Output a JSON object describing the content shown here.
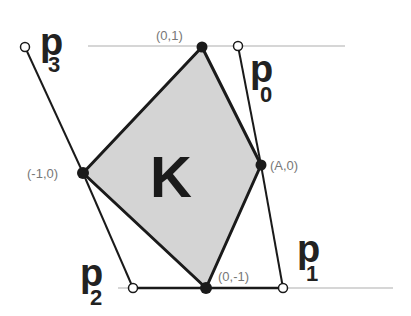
{
  "diagram": {
    "shape_label": "K",
    "vertices": [
      {
        "id": "top",
        "label": "(0,1)",
        "x": 202,
        "y": 47
      },
      {
        "id": "left",
        "label": "(-1,0)",
        "x": 83,
        "y": 173
      },
      {
        "id": "bottom",
        "label": "(0,-1)",
        "x": 206,
        "y": 288
      },
      {
        "id": "right",
        "label": "(A,0)",
        "x": 261,
        "y": 165
      }
    ],
    "outer_points": [
      {
        "id": "p0",
        "base": "p",
        "sub": "0",
        "x": 238,
        "y": 46
      },
      {
        "id": "p1",
        "base": "p",
        "sub": "1",
        "x": 283,
        "y": 288
      },
      {
        "id": "p2",
        "base": "p",
        "sub": "2",
        "x": 133,
        "y": 288
      },
      {
        "id": "p3",
        "base": "p",
        "sub": "3",
        "x": 25,
        "y": 47
      }
    ],
    "colors": {
      "fill": "#d4d4d4",
      "stroke": "#1a1a1a",
      "guide": "#c8c8c8",
      "coord_text": "#777777"
    }
  }
}
